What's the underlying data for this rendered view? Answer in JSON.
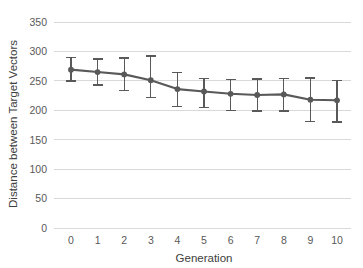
{
  "chart_data": {
    "type": "line",
    "title": "",
    "xlabel": "Generation",
    "ylabel": "Distance between Target Vectors",
    "x": [
      0,
      1,
      2,
      3,
      4,
      5,
      6,
      7,
      8,
      9,
      10
    ],
    "xtick_labels": [
      "0",
      "1",
      "2",
      "3",
      "4",
      "5",
      "6",
      "7",
      "8",
      "9",
      "10"
    ],
    "ytick_labels": [
      "0",
      "50",
      "100",
      "150",
      "200",
      "250",
      "300",
      "350"
    ],
    "ytick_values": [
      0,
      50,
      100,
      150,
      200,
      250,
      300,
      350
    ],
    "xlim": [
      -0.5,
      10.5
    ],
    "ylim": [
      0,
      350
    ],
    "grid": "horizontal",
    "legend": "none",
    "series": [
      {
        "name": "Distance between Target Vectors",
        "values": [
          269,
          265,
          261,
          251,
          236,
          232,
          228,
          226,
          227,
          218,
          217
        ],
        "error_upper": [
          21,
          22,
          28,
          41,
          28,
          22,
          24,
          27,
          27,
          37,
          34
        ],
        "error_lower": [
          19,
          22,
          27,
          29,
          29,
          27,
          28,
          27,
          28,
          37,
          37
        ],
        "line_color": "#595959",
        "marker": "circle",
        "marker_color": "#595959"
      }
    ]
  },
  "style": {
    "background": "#ffffff",
    "gridline_color": "#d9d9d9",
    "text_color": "#595959",
    "axis_title_color": "#404040"
  }
}
